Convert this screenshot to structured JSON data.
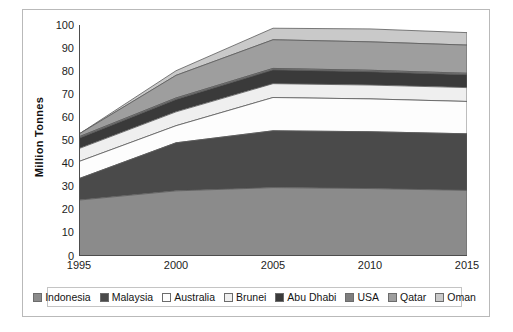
{
  "chart_data": {
    "type": "area",
    "stacked": true,
    "title": "",
    "subtitle": "",
    "xlabel": "",
    "ylabel": "Million Tonnes",
    "x": [
      1995,
      2000,
      2005,
      2010,
      2015
    ],
    "xtick_labels": [
      "1995",
      "2000",
      "2005",
      "2010",
      "2015"
    ],
    "ytick_labels": [
      "0",
      "10",
      "20",
      "30",
      "40",
      "50",
      "60",
      "70",
      "80",
      "90",
      "100"
    ],
    "yticks": [
      0,
      10,
      20,
      30,
      40,
      50,
      60,
      70,
      80,
      90,
      100
    ],
    "ylim": [
      0,
      100
    ],
    "xlim": [
      1995,
      2015
    ],
    "grid": false,
    "legend_position": "bottom",
    "series": [
      {
        "name": "Indonesia",
        "color": "#8b8b8b",
        "values": [
          24.2,
          28.2,
          29.6,
          29.2,
          28.4
        ]
      },
      {
        "name": "Malaysia",
        "color": "#4a4a4a",
        "values": [
          9.3,
          20.8,
          24.6,
          24.6,
          24.5
        ]
      },
      {
        "name": "Australia",
        "color": "#fdfdfd",
        "values": [
          7.4,
          7.4,
          14.4,
          14.2,
          14.0
        ]
      },
      {
        "name": "Brunei",
        "color": "#efefef",
        "values": [
          5.6,
          6.0,
          6.0,
          6.0,
          6.0
        ]
      },
      {
        "name": "Abu Dhabi",
        "color": "#3a3a3a",
        "values": [
          4.5,
          5.4,
          6.0,
          5.8,
          5.6
        ]
      },
      {
        "name": "USA",
        "color": "#7e7e7e",
        "values": [
          0.6,
          0.6,
          0.6,
          0.6,
          0.6
        ]
      },
      {
        "name": "Qatar",
        "color": "#9e9e9e",
        "values": [
          1.2,
          9.8,
          12.4,
          12.3,
          12.2
        ]
      },
      {
        "name": "Oman",
        "color": "#c9c9c9",
        "values": [
          0.0,
          2.0,
          5.0,
          5.6,
          5.4
        ]
      }
    ],
    "cumulative_tops": [
      {
        "name": "Indonesia",
        "values": [
          24.2,
          28.2,
          29.6,
          29.2,
          28.4
        ]
      },
      {
        "name": "Malaysia",
        "values": [
          33.5,
          49.0,
          54.2,
          53.8,
          52.9
        ]
      },
      {
        "name": "Australia",
        "values": [
          40.9,
          56.4,
          68.6,
          68.0,
          66.9
        ]
      },
      {
        "name": "Brunei",
        "values": [
          46.5,
          62.4,
          74.6,
          74.0,
          72.9
        ]
      },
      {
        "name": "Abu Dhabi",
        "values": [
          51.0,
          67.8,
          80.6,
          79.8,
          78.5
        ]
      },
      {
        "name": "USA",
        "values": [
          51.6,
          68.4,
          81.2,
          80.4,
          79.1
        ]
      },
      {
        "name": "Qatar",
        "values": [
          52.8,
          78.2,
          93.6,
          92.7,
          91.3
        ]
      },
      {
        "name": "Oman",
        "values": [
          52.8,
          80.2,
          98.6,
          98.3,
          96.7
        ]
      }
    ]
  },
  "axis": {
    "ylabel": "Million Tonnes"
  },
  "legend": {
    "items": [
      {
        "label": "Indonesia",
        "color": "#8b8b8b"
      },
      {
        "label": "Malaysia",
        "color": "#4a4a4a"
      },
      {
        "label": "Australia",
        "color": "#fdfdfd"
      },
      {
        "label": "Brunei",
        "color": "#efefef"
      },
      {
        "label": "Abu Dhabi",
        "color": "#3a3a3a"
      },
      {
        "label": "USA",
        "color": "#7e7e7e"
      },
      {
        "label": "Qatar",
        "color": "#9e9e9e"
      },
      {
        "label": "Oman",
        "color": "#c9c9c9"
      }
    ]
  }
}
